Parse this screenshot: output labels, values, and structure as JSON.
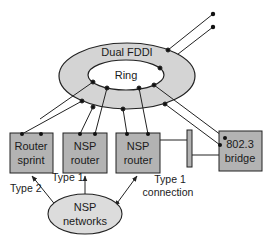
{
  "diagram": {
    "ring": {
      "outer_label": "Dual FDDI",
      "inner_label": "Ring"
    },
    "nodes": [
      {
        "id": "router-sprint",
        "line1": "Router",
        "line2": "sprint"
      },
      {
        "id": "nsp-router-1",
        "line1": "NSP",
        "line2": "router"
      },
      {
        "id": "nsp-router-2",
        "line1": "NSP",
        "line2": "router"
      },
      {
        "id": "bridge",
        "line1": "802.3",
        "line2": "bridge"
      }
    ],
    "cloud": {
      "line1": "NSP",
      "line2": "networks"
    },
    "edge_labels": {
      "type2": "Type 2",
      "type1": "Type 1",
      "type1_conn_line1": "Type 1",
      "type1_conn_line2": "connection"
    },
    "colors": {
      "ring_fill": "#d4d4d4",
      "box_fill": "#b3b3b3",
      "cloud_fill": "#dcdcdc",
      "stroke": "#222222",
      "background": "#ffffff"
    }
  }
}
